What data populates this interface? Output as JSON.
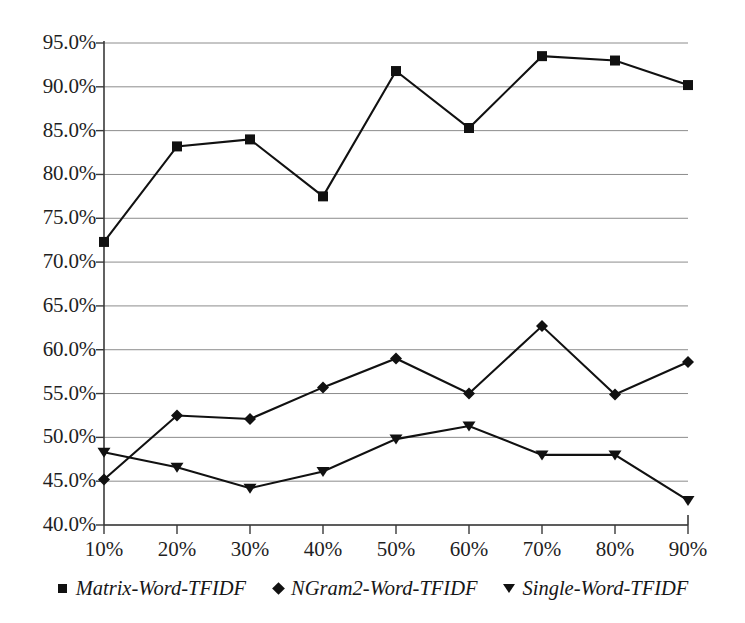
{
  "chart_data": {
    "type": "line",
    "title": "",
    "subtitle": "",
    "xlabel": "",
    "ylabel": "",
    "categories": [
      "10%",
      "20%",
      "30%",
      "40%",
      "50%",
      "60%",
      "70%",
      "80%",
      "90%"
    ],
    "x_values": [
      10,
      20,
      30,
      40,
      50,
      60,
      70,
      80,
      90
    ],
    "xlim": [
      10,
      90
    ],
    "ylim": [
      40.0,
      95.0
    ],
    "y_tick_labels": [
      "95.0%",
      "90.0%",
      "85.0%",
      "80.0%",
      "75.0%",
      "70.0%",
      "65.0%",
      "60.0%",
      "55.0%",
      "50.0%",
      "45.0%",
      "40.0%"
    ],
    "y_tick_values": [
      95.0,
      90.0,
      85.0,
      80.0,
      75.0,
      70.0,
      65.0,
      60.0,
      55.0,
      50.0,
      45.0,
      40.0
    ],
    "grid": true,
    "grid_axis": "y",
    "legend_position": "bottom",
    "series": [
      {
        "name": "Matrix-Word-TFIDF",
        "marker": "square",
        "color": "#111111",
        "values": [
          72.3,
          83.2,
          84.0,
          77.5,
          91.8,
          85.3,
          93.5,
          93.0,
          90.2
        ]
      },
      {
        "name": "NGram2-Word-TFIDF",
        "marker": "diamond",
        "color": "#111111",
        "values": [
          45.2,
          52.5,
          52.1,
          55.7,
          59.0,
          55.0,
          62.7,
          54.9,
          58.6
        ]
      },
      {
        "name": "Single-Word-TFIDF",
        "marker": "triangle-down",
        "color": "#111111",
        "values": [
          48.3,
          46.6,
          44.2,
          46.1,
          49.8,
          51.3,
          48.0,
          48.0,
          42.8
        ]
      }
    ]
  },
  "legend": {
    "entries": [
      {
        "label": "Matrix-Word-TFIDF",
        "marker": "square"
      },
      {
        "label": "NGram2-Word-TFIDF",
        "marker": "diamond"
      },
      {
        "label": "Single-Word-TFIDF",
        "marker": "triangle-down"
      }
    ]
  },
  "axes": {
    "line_color": "#3a3a3a",
    "grid_color": "#8c8c8c"
  }
}
